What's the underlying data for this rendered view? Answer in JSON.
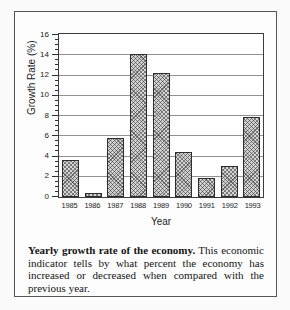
{
  "chart_data": {
    "type": "bar",
    "categories": [
      "1985",
      "1986",
      "1987",
      "1988",
      "1989",
      "1990",
      "1991",
      "1992",
      "1993"
    ],
    "values": [
      3.6,
      0.4,
      5.8,
      14.0,
      12.2,
      4.4,
      1.9,
      3.0,
      7.9
    ],
    "title": "Yearly growth rate of the economy",
    "xlabel": "Year",
    "ylabel": "Growth Rate (%)",
    "ylim": [
      0,
      16
    ],
    "yticks": [
      0,
      2,
      4,
      6,
      8,
      10,
      12,
      14,
      16
    ],
    "minor_tick_step": 0.5,
    "grid": true,
    "legend": "none",
    "bar_fill": "#d4d4d4",
    "bar_hatch": "diagonal-crosshatch",
    "bar_border": "#2d2d2d",
    "gridline_color": "#919191",
    "plot_border_color": "#3c3c3c",
    "frame_border_color": "#565656"
  },
  "caption": {
    "lead": "Yearly growth rate of the economy.",
    "body": " This economic indicator tells by what percent the economy has increased or decreased when compared with the previous year."
  }
}
